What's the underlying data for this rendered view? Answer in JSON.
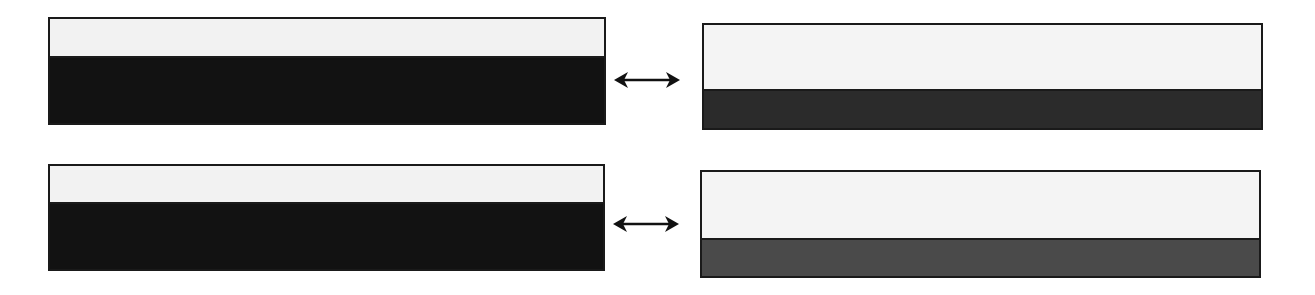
{
  "diagram": {
    "rows": [
      {
        "left": {
          "light_ratio": 0.35,
          "dark_color": "#121212",
          "light_color": "#f2f2f2"
        },
        "connector": "bidirectional-arrow",
        "right": {
          "light_ratio": 0.62,
          "dark_color": "#2b2b2b",
          "light_color": "#f4f4f4"
        }
      },
      {
        "left": {
          "light_ratio": 0.34,
          "dark_color": "#121212",
          "light_color": "#f2f2f2"
        },
        "connector": "bidirectional-arrow",
        "right": {
          "light_ratio": 0.63,
          "dark_color": "#4a4a4a",
          "light_color": "#f4f4f4"
        }
      }
    ]
  }
}
